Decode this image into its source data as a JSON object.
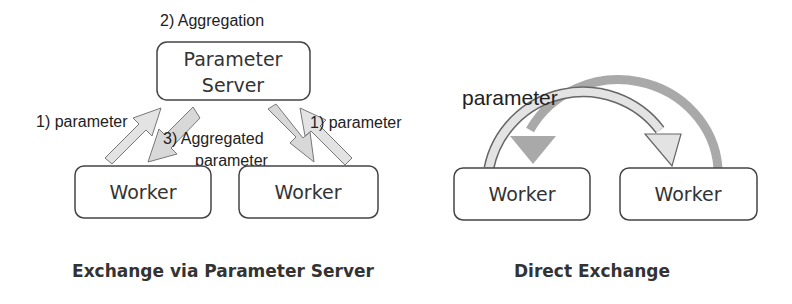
{
  "left_diagram": {
    "caption": "Exchange via Parameter Server",
    "server_label_line1": "Parameter",
    "server_label_line2": "Server",
    "step_aggregation": "2) Aggregation",
    "step_parameter_left": "1) parameter",
    "step_parameter_right": "1) parameter",
    "step_aggregated_line1": "3) Aggregated",
    "step_aggregated_line2": "parameter",
    "workers": [
      "Worker",
      "Worker"
    ]
  },
  "right_diagram": {
    "caption": "Direct Exchange",
    "arrow_label": "parameter",
    "workers": [
      "Worker",
      "Worker"
    ]
  },
  "colors": {
    "arrow_light": "#e3e3e3",
    "arrow_dark": "#a9a9a9",
    "stroke": "#555555",
    "text": "#222222"
  }
}
